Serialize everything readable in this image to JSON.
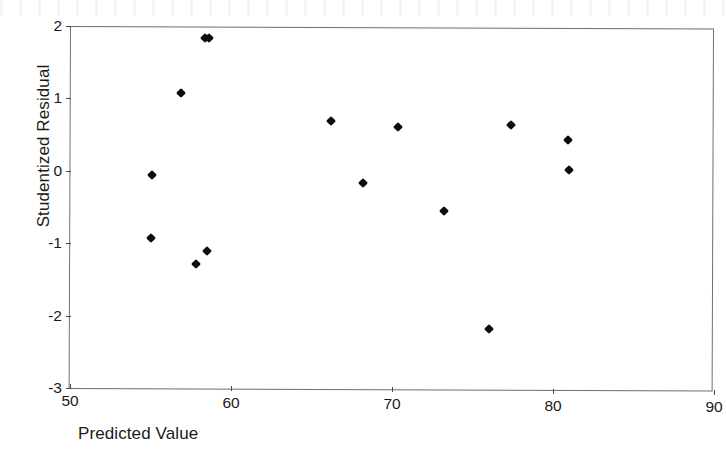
{
  "figure": {
    "background_color": "#ffffff",
    "axis_color": "#6f6f6f",
    "marker_color": "#0d0d0d",
    "marker_shape": "diamond"
  },
  "chart_data": {
    "type": "scatter",
    "title": "",
    "xlabel": "Predicted Value",
    "ylabel": "Studentized Residual",
    "xlim": [
      50,
      90
    ],
    "ylim": [
      -3,
      2
    ],
    "xticks": [
      50,
      60,
      70,
      80,
      90
    ],
    "yticks": [
      2,
      1,
      0,
      -1,
      -2,
      -3
    ],
    "xtick_labels": [
      "50",
      "60",
      "70",
      "80",
      "90"
    ],
    "ytick_labels": [
      "2",
      "1",
      "0",
      "-1",
      "-2",
      "-3"
    ],
    "grid": false,
    "legend": false,
    "n_points": 15,
    "series": [
      {
        "name": "Studentized residuals",
        "marker": "diamond",
        "color": "#0d0d0d",
        "points": [
          {
            "x": 55.1,
            "y": -0.06
          },
          {
            "x": 55.0,
            "y": -0.93
          },
          {
            "x": 56.9,
            "y": 1.07
          },
          {
            "x": 57.8,
            "y": -1.28
          },
          {
            "x": 58.5,
            "y": -1.11
          },
          {
            "x": 58.6,
            "y": 1.84
          },
          {
            "x": 66.2,
            "y": 0.69
          },
          {
            "x": 68.2,
            "y": -0.17
          },
          {
            "x": 70.4,
            "y": 0.6
          },
          {
            "x": 73.2,
            "y": -0.55
          },
          {
            "x": 76.0,
            "y": -2.19
          },
          {
            "x": 77.4,
            "y": 0.63
          },
          {
            "x": 80.9,
            "y": 0.43
          },
          {
            "x": 81.0,
            "y": 0.01
          },
          {
            "x": 58.4,
            "y": 1.84
          }
        ]
      }
    ]
  }
}
